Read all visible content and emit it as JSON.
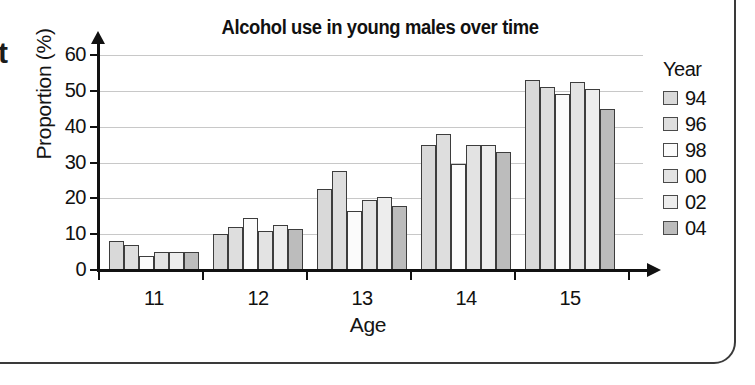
{
  "frame": {
    "stray_glyph": "t"
  },
  "chart_data": {
    "type": "bar",
    "title": "Alcohol use in young males over time",
    "xlabel": "Age",
    "ylabel": "Proportion (%)",
    "categories": [
      "11",
      "12",
      "13",
      "14",
      "15"
    ],
    "ylim": [
      0,
      60
    ],
    "yticks": [
      0,
      10,
      20,
      30,
      40,
      50,
      60
    ],
    "grid": true,
    "legend_title": "Year",
    "legend_position": "right",
    "series": [
      {
        "name": "94",
        "color": "#d9d9d9",
        "values": [
          8,
          10,
          22.5,
          35,
          53
        ]
      },
      {
        "name": "96",
        "color": "#dedede",
        "values": [
          7,
          12,
          27.5,
          38,
          51
        ]
      },
      {
        "name": "98",
        "color": "#fbfbfb",
        "values": [
          4,
          14.5,
          16.5,
          29.5,
          49
        ]
      },
      {
        "name": "00",
        "color": "#e3e3e3",
        "values": [
          5,
          11,
          19.5,
          35,
          52.5
        ]
      },
      {
        "name": "02",
        "color": "#ededed",
        "values": [
          5,
          12.5,
          20.5,
          35,
          50.5
        ]
      },
      {
        "name": "04",
        "color": "#bcbcbc",
        "values": [
          5,
          11.5,
          18,
          33,
          45
        ]
      }
    ]
  }
}
